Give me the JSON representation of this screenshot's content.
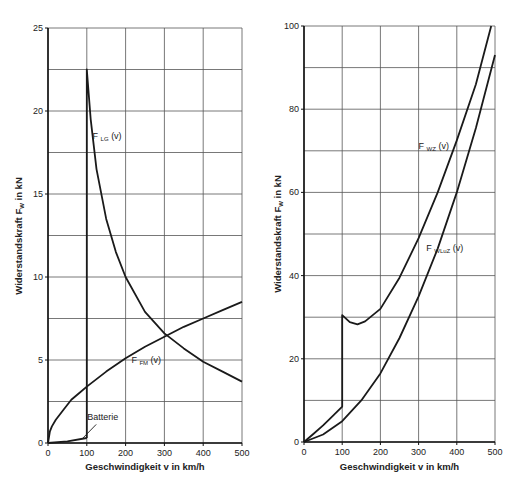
{
  "chart_data": [
    {
      "type": "line",
      "title": "",
      "xlabel": "Geschwindigkeit v in km/h",
      "ylabel": "Widerstandskraft F_W in kN",
      "xlim": [
        0,
        500
      ],
      "ylim": [
        0,
        25
      ],
      "x_ticks": [
        0,
        100,
        200,
        300,
        400,
        500
      ],
      "y_ticks": [
        0,
        5,
        10,
        15,
        20,
        25
      ],
      "grid": {
        "x_step": 100,
        "y_step": 2.5
      },
      "series": [
        {
          "name": "F_LG (v)",
          "label_main": "F",
          "label_sub": "LG",
          "label_tail": "(v)",
          "x": [
            100,
            100,
            110,
            125,
            150,
            175,
            200,
            250,
            300,
            350,
            400,
            450,
            500
          ],
          "y": [
            0.3,
            22.5,
            19.5,
            16.5,
            13.5,
            11.5,
            10.0,
            7.9,
            6.6,
            5.7,
            4.9,
            4.3,
            3.7
          ]
        },
        {
          "name": "F_FM (v)",
          "label_main": "F",
          "label_sub": "FM",
          "label_tail": "(v)",
          "x": [
            0,
            5,
            10,
            20,
            40,
            60,
            80,
            100,
            150,
            200,
            250,
            300,
            350,
            400,
            450,
            500
          ],
          "y": [
            0,
            0.7,
            1.0,
            1.4,
            2.0,
            2.6,
            3.0,
            3.4,
            4.3,
            5.1,
            5.8,
            6.4,
            7.0,
            7.5,
            8.0,
            8.5
          ]
        },
        {
          "name": "Batterie",
          "x": [
            0,
            50,
            100
          ],
          "y": [
            0,
            0.1,
            0.3
          ]
        }
      ],
      "annotations": [
        {
          "text": "Batterie",
          "x": 132,
          "y": 1.3,
          "arrow_to": [
            88,
            0.25
          ]
        }
      ]
    },
    {
      "type": "line",
      "title": "",
      "xlabel": "Geschwindigkeit v in km/h",
      "ylabel": "Widerstandskraft F_W in kN",
      "xlim": [
        0,
        500
      ],
      "ylim": [
        0,
        100
      ],
      "x_ticks": [
        0,
        100,
        200,
        300,
        400,
        500
      ],
      "y_ticks": [
        0,
        20,
        40,
        60,
        80,
        100
      ],
      "grid": {
        "x_step": 100,
        "y_step": 10
      },
      "series": [
        {
          "name": "F_WZ (v)",
          "label_main": "F",
          "label_sub": "WZ",
          "label_tail": "(v)",
          "x": [
            0,
            25,
            50,
            75,
            100,
            100,
            120,
            140,
            160,
            200,
            250,
            300,
            350,
            400,
            450,
            490
          ],
          "y": [
            0,
            2.0,
            4.0,
            6.2,
            8.5,
            30.5,
            28.8,
            28.3,
            29.0,
            32.0,
            39.5,
            49.0,
            60.0,
            72.5,
            86.0,
            100
          ]
        },
        {
          "name": "F_WLuZ (v)",
          "label_main": "F",
          "label_sub": "WLuZ",
          "label_tail": "(v)",
          "x": [
            0,
            50,
            100,
            150,
            200,
            250,
            300,
            350,
            400,
            450,
            500
          ],
          "y": [
            0,
            1.8,
            5.0,
            10.0,
            16.5,
            25.0,
            35.0,
            46.5,
            60.0,
            75.5,
            93.0
          ]
        }
      ]
    }
  ]
}
